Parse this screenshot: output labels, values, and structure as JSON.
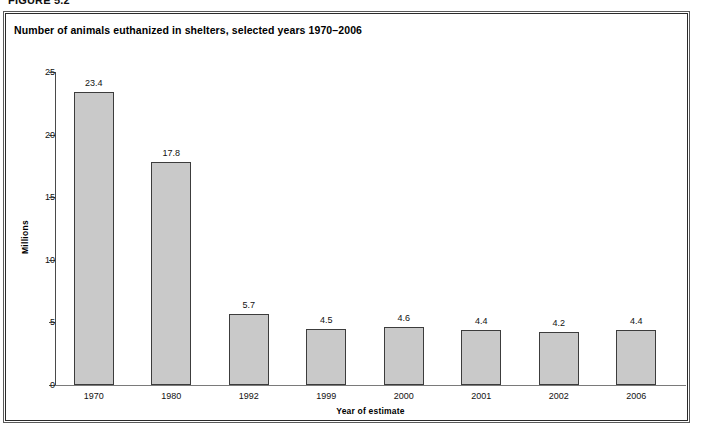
{
  "figure": {
    "caption": "FIGURE 5.2"
  },
  "chart_data": {
    "type": "bar",
    "title": "Number of animals euthanized in shelters, selected years 1970–2006",
    "xlabel": "Year of estimate",
    "ylabel": "Millions",
    "categories": [
      "1970",
      "1980",
      "1992",
      "1999",
      "2000",
      "2001",
      "2002",
      "2006"
    ],
    "values": [
      23.4,
      17.8,
      5.7,
      4.5,
      4.6,
      4.4,
      4.2,
      4.4
    ],
    "value_labels": [
      "23.4",
      "17.8",
      "5.7",
      "4.5",
      "4.6",
      "4.4",
      "4.2",
      "4.4"
    ],
    "ylim": [
      0,
      25
    ],
    "yticks": [
      0,
      5,
      10,
      15,
      20,
      25
    ],
    "ytick_labels": [
      "0",
      "5",
      "10",
      "15",
      "20",
      "25"
    ],
    "grid": false,
    "legend": null,
    "bar_color": "#c9c9c9",
    "bar_border_color": "#3c3c3c",
    "axis_color": "#4a4a4a"
  }
}
